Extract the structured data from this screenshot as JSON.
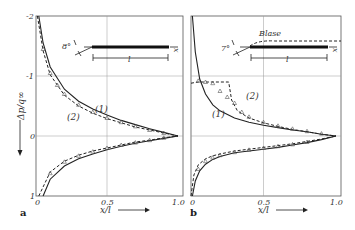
{
  "chart_data": [
    {
      "type": "line",
      "panel_label": "a",
      "xlabel": "x/l",
      "ylabel": "Δp/q∞",
      "xlim": [
        0,
        1.0
      ],
      "ylim": [
        -2,
        1
      ],
      "y_inverted": true,
      "grid": true,
      "x_ticks": [
        "0",
        "0.5",
        "1.0"
      ],
      "y_ticks": [
        "-2",
        "-1",
        "0",
        "1"
      ],
      "inset": {
        "angle_label": "8°",
        "length_label": "l",
        "axis_label": "x"
      },
      "series": [
        {
          "name": "(1)",
          "style": "solid",
          "surface": "upper",
          "x": [
            0.02,
            0.05,
            0.1,
            0.2,
            0.3,
            0.4,
            0.5,
            0.6,
            0.7,
            0.8,
            0.9,
            1.0
          ],
          "y": [
            -2.0,
            -1.55,
            -1.15,
            -0.78,
            -0.58,
            -0.45,
            -0.35,
            -0.26,
            -0.19,
            -0.12,
            -0.06,
            0.0
          ]
        },
        {
          "name": "(2)",
          "style": "dashed",
          "surface": "upper",
          "x": [
            0.01,
            0.05,
            0.1,
            0.2,
            0.3,
            0.4,
            0.5,
            0.6,
            0.7,
            0.8,
            0.9,
            1.0
          ],
          "y": [
            -2.0,
            -1.42,
            -1.02,
            -0.68,
            -0.5,
            -0.38,
            -0.29,
            -0.22,
            -0.15,
            -0.1,
            -0.05,
            0.0
          ]
        },
        {
          "name": "(1)",
          "style": "solid",
          "surface": "lower",
          "x": [
            0.05,
            0.1,
            0.2,
            0.3,
            0.4,
            0.5,
            0.6,
            0.7,
            0.8,
            0.9,
            1.0
          ],
          "y": [
            1.0,
            0.72,
            0.5,
            0.38,
            0.3,
            0.23,
            0.17,
            0.12,
            0.08,
            0.04,
            0.0
          ]
        },
        {
          "name": "(2)",
          "style": "dashed",
          "surface": "lower",
          "x": [
            0.02,
            0.1,
            0.2,
            0.3,
            0.4,
            0.5,
            0.6,
            0.7,
            0.8,
            0.9,
            1.0
          ],
          "y": [
            1.0,
            0.6,
            0.42,
            0.32,
            0.25,
            0.2,
            0.15,
            0.1,
            0.07,
            0.03,
            0.0
          ]
        },
        {
          "name": "measured",
          "style": "markers",
          "marker": "triangle",
          "x": [
            0.05,
            0.1,
            0.15,
            0.2,
            0.3,
            0.4,
            0.5,
            0.6,
            0.7,
            0.8,
            0.9,
            0.1,
            0.2,
            0.3,
            0.4,
            0.5,
            0.6,
            0.7,
            0.8,
            0.9
          ],
          "y": [
            -1.45,
            -1.05,
            -0.85,
            -0.7,
            -0.52,
            -0.4,
            -0.3,
            -0.23,
            -0.16,
            -0.1,
            -0.05,
            0.62,
            0.43,
            0.33,
            0.26,
            0.2,
            0.15,
            0.11,
            0.07,
            0.03
          ]
        }
      ]
    },
    {
      "type": "line",
      "panel_label": "b",
      "xlabel": "x/l",
      "ylabel": "Δp/q∞",
      "xlim": [
        0,
        1.0
      ],
      "ylim": [
        -2,
        1
      ],
      "y_inverted": true,
      "grid": true,
      "x_ticks": [
        "0",
        "0.5",
        "1.0"
      ],
      "y_ticks": [],
      "inset": {
        "angle_label": "7°",
        "length_label": "l",
        "axis_label": "x",
        "bubble_label": "Blase"
      },
      "series": [
        {
          "name": "(1)",
          "style": "solid",
          "surface": "upper",
          "x": [
            0.01,
            0.03,
            0.06,
            0.1,
            0.15,
            0.2,
            0.3,
            0.4,
            0.5,
            0.6,
            0.7,
            0.8,
            0.9,
            1.0
          ],
          "y": [
            -2.0,
            -1.4,
            -0.95,
            -0.7,
            -0.52,
            -0.42,
            -0.3,
            -0.23,
            -0.18,
            -0.14,
            -0.1,
            -0.07,
            -0.03,
            0.0
          ]
        },
        {
          "name": "(2)",
          "style": "dashed",
          "surface": "upper",
          "x": [
            0.0,
            0.05,
            0.1,
            0.2,
            0.26,
            0.28,
            0.32,
            0.4,
            0.5,
            0.6,
            0.7,
            0.8,
            0.9,
            1.0
          ],
          "y": [
            -0.88,
            -0.9,
            -0.9,
            -0.9,
            -0.9,
            -0.6,
            -0.42,
            -0.3,
            -0.22,
            -0.16,
            -0.11,
            -0.07,
            -0.03,
            0.0
          ]
        },
        {
          "name": "(1)",
          "style": "solid",
          "surface": "lower",
          "x": [
            0.01,
            0.03,
            0.06,
            0.1,
            0.15,
            0.2,
            0.3,
            0.4,
            0.5,
            0.6,
            0.7,
            0.8,
            0.9,
            1.0
          ],
          "y": [
            1.0,
            0.75,
            0.58,
            0.47,
            0.39,
            0.34,
            0.28,
            0.25,
            0.22,
            0.19,
            0.15,
            0.11,
            0.06,
            0.0
          ]
        },
        {
          "name": "(2)",
          "style": "dashed",
          "surface": "lower",
          "x": [
            0.0,
            0.02,
            0.05,
            0.1,
            0.15,
            0.2,
            0.3,
            0.4,
            0.5,
            0.6,
            0.7,
            0.8,
            0.9,
            1.0
          ],
          "y": [
            1.0,
            0.65,
            0.48,
            0.38,
            0.33,
            0.3,
            0.25,
            0.22,
            0.19,
            0.16,
            0.13,
            0.09,
            0.05,
            0.0
          ]
        },
        {
          "name": "measured",
          "style": "markers",
          "marker": "triangle",
          "x": [
            0.05,
            0.1,
            0.15,
            0.2,
            0.25,
            0.3,
            0.35,
            0.4,
            0.5,
            0.6,
            0.7,
            0.8,
            0.9,
            0.05,
            0.1,
            0.15,
            0.2,
            0.3,
            0.4,
            0.5,
            0.6,
            0.7,
            0.8
          ],
          "y": [
            -0.92,
            -0.9,
            -0.88,
            -0.75,
            -0.65,
            -0.55,
            -0.4,
            -0.32,
            -0.23,
            -0.17,
            -0.12,
            -0.08,
            -0.04,
            0.55,
            0.42,
            0.36,
            0.32,
            0.27,
            0.23,
            0.2,
            0.17,
            0.14,
            0.1
          ]
        }
      ]
    }
  ]
}
